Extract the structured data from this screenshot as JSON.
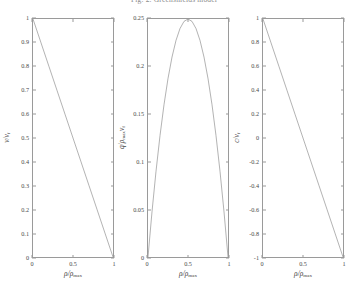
{
  "figure": {
    "title": "Fig. 2. Greenshields model",
    "background": "#ffffff",
    "line_color": "#555555",
    "axis_color": "#9a9a9a",
    "width": 348,
    "height": 294
  },
  "chart_data": [
    {
      "type": "line",
      "id": "speed-density",
      "title": "",
      "xlabel": "ρ/ρmax",
      "ylabel": "v/vf",
      "xlim": [
        0,
        1
      ],
      "ylim": [
        0,
        1
      ],
      "grid": false,
      "legend": null,
      "xticks": [
        0,
        0.5,
        1
      ],
      "xticklabels": [
        "0",
        "0.5",
        "1"
      ],
      "yticks": [
        0,
        0.1,
        0.2,
        0.3,
        0.4,
        0.5,
        0.6,
        0.7,
        0.8,
        0.9,
        1
      ],
      "yticklabels": [
        "0",
        "0.1",
        "0.2",
        "0.3",
        "0.4",
        "0.5",
        "0.6",
        "0.7",
        "0.8",
        "0.9",
        "1"
      ],
      "x": [
        0,
        0.1,
        0.2,
        0.3,
        0.4,
        0.5,
        0.6,
        0.7,
        0.8,
        0.9,
        1
      ],
      "values": [
        1,
        0.9,
        0.8,
        0.7,
        0.6,
        0.5,
        0.4,
        0.3,
        0.2,
        0.1,
        0
      ]
    },
    {
      "type": "line",
      "id": "flow-density",
      "title": "",
      "xlabel": "ρ/ρmax",
      "ylabel": "q/(ρmax vf)",
      "xlim": [
        0,
        1
      ],
      "ylim": [
        0,
        0.25
      ],
      "grid": false,
      "legend": null,
      "xticks": [
        0,
        0.5,
        1
      ],
      "xticklabels": [
        "0",
        "0.5",
        "1"
      ],
      "yticks": [
        0,
        0.05,
        0.1,
        0.15,
        0.2,
        0.25
      ],
      "yticklabels": [
        "0",
        "0.05",
        "0.1",
        "0.15",
        "0.2",
        "0.25"
      ],
      "x": [
        0,
        0.05,
        0.1,
        0.15,
        0.2,
        0.25,
        0.3,
        0.35,
        0.4,
        0.45,
        0.5,
        0.55,
        0.6,
        0.65,
        0.7,
        0.75,
        0.8,
        0.85,
        0.9,
        0.95,
        1
      ],
      "values": [
        0,
        0.0475,
        0.09,
        0.1275,
        0.16,
        0.1875,
        0.21,
        0.2275,
        0.24,
        0.2475,
        0.25,
        0.2475,
        0.24,
        0.2275,
        0.21,
        0.1875,
        0.16,
        0.1275,
        0.09,
        0.0475,
        0
      ]
    },
    {
      "type": "line",
      "id": "wavespeed-density",
      "title": "",
      "xlabel": "ρ/ρmax",
      "ylabel": "c/vf",
      "xlim": [
        0,
        1
      ],
      "ylim": [
        -1,
        1
      ],
      "grid": false,
      "legend": null,
      "xticks": [
        0,
        0.5,
        1
      ],
      "xticklabels": [
        "0",
        "0.5",
        "1"
      ],
      "yticks": [
        -1,
        -0.8,
        -0.6,
        -0.4,
        -0.2,
        0,
        0.2,
        0.4,
        0.6,
        0.8,
        1
      ],
      "yticklabels": [
        "-1",
        "-0.8",
        "-0.6",
        "-0.4",
        "-0.2",
        "0",
        "0.2",
        "0.4",
        "0.6",
        "0.8",
        "1"
      ],
      "x": [
        0,
        0.1,
        0.2,
        0.3,
        0.4,
        0.5,
        0.6,
        0.7,
        0.8,
        0.9,
        1
      ],
      "values": [
        1,
        0.8,
        0.6,
        0.4,
        0.2,
        0,
        -0.2,
        -0.4,
        -0.6,
        -0.8,
        -1
      ]
    }
  ]
}
